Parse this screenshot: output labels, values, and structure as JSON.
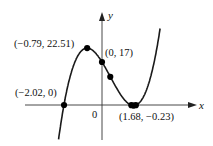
{
  "chart_data": {
    "type": "line",
    "title": "",
    "function": "y = 3x^3 - 4x^2 - 12x + 17",
    "xlabel": "x",
    "ylabel": "y",
    "origin_label": "0",
    "grid": false,
    "legend": null,
    "xlim": [
      -2.35,
      3.0
    ],
    "ylim": [
      -12.5,
      35
    ],
    "labeled_points": [
      {
        "x": -2.02,
        "y": 0,
        "label": "(−2.02, 0)"
      },
      {
        "x": -0.79,
        "y": 22.51,
        "label": "(−0.79, 22.51)"
      },
      {
        "x": 0,
        "y": 17,
        "label": "(0, 17)"
      },
      {
        "x": 1.68,
        "y": -0.23,
        "label": "(1.68, −0.23)"
      }
    ],
    "unlabeled_points": [
      {
        "x": 0.44,
        "y": 11.14
      }
    ],
    "colors": {
      "curve": "#1a1a1a",
      "axes": "#333333",
      "points": "#000000"
    }
  }
}
